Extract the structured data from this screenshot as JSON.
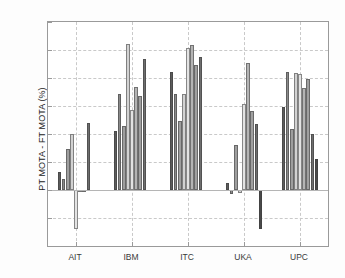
{
  "chart_data": {
    "type": "bar",
    "title": "",
    "subtitle": "",
    "xlabel": "",
    "ylabel": "PT MOTA - FT MOTA (%)",
    "categories": [
      "AIT",
      "IBM",
      "ITC",
      "UKA",
      "UPC"
    ],
    "ylim": [
      -20,
      60
    ],
    "yticks": [
      -20,
      -10,
      0,
      10,
      20,
      30,
      40,
      50,
      60
    ],
    "ytick_labels": [
      "-20",
      "-10",
      "0",
      "10",
      "20",
      "30",
      "40",
      "50",
      "60"
    ],
    "grid": true,
    "legend": null,
    "legend_position": "none",
    "series": [
      {
        "name": "s1",
        "color": "#5c5c5c",
        "values": [
          6.6,
          21.0,
          42.2,
          2.6,
          29.8
        ]
      },
      {
        "name": "s2",
        "color": "#8a8a8a",
        "values": [
          4.0,
          34.4,
          34.4,
          -1.3,
          42.3
        ]
      },
      {
        "name": "s3",
        "color": "#9e9e9e",
        "values": [
          14.5,
          22.9,
          24.8,
          15.9,
          21.8
        ]
      },
      {
        "name": "s4",
        "color": "#d2d2d2",
        "values": [
          20.1,
          52.1,
          34.3,
          -0.9,
          41.8
        ]
      },
      {
        "name": "s5",
        "color": "#e3e3e3",
        "values": [
          -13.9,
          28.6,
          50.7,
          30.7,
          41.4
        ]
      },
      {
        "name": "s6",
        "color": "#b4b4b4",
        "values": [
          -0.8,
          36.9,
          51.7,
          45.2,
          36.4
        ]
      },
      {
        "name": "s7",
        "color": "#a0a0a0",
        "values": [
          -0.5,
          33.4,
          44.6,
          28.3,
          39.5
        ]
      },
      {
        "name": "s8",
        "color": "#6e6e6e",
        "values": [
          23.9,
          46.7,
          47.6,
          23.7,
          20.1
        ]
      },
      {
        "name": "s9",
        "color": "#4a4a4a",
        "values": [
          0,
          0,
          0,
          -13.8,
          11.1
        ]
      }
    ]
  }
}
